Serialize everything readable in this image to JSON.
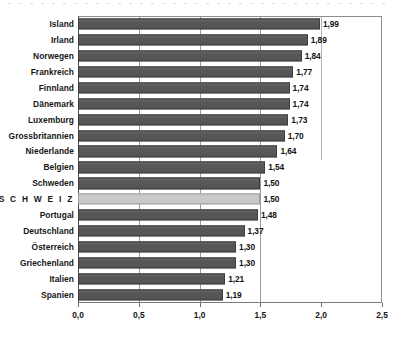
{
  "chart_data": {
    "type": "bar",
    "orientation": "horizontal",
    "title": "",
    "subtitle": "",
    "xlabel": "",
    "ylabel": "",
    "xlim": [
      0.0,
      2.5
    ],
    "xticks": [
      0.0,
      0.5,
      1.0,
      1.5,
      2.0,
      2.5
    ],
    "xtick_labels": [
      "0,0",
      "0,5",
      "1,0",
      "1,5",
      "2,0",
      "2,5"
    ],
    "grid": true,
    "gridlines_at": [
      0.5,
      1.0,
      1.5,
      2.0
    ],
    "legend": null,
    "decimal_separator": ",",
    "highlight_category": "S C H W E I Z",
    "colors": {
      "bar": "#585858",
      "bar_border": "#3e3e3e",
      "highlight_bar": "#c9c9c9",
      "highlight_bar_border": "#9d9d9d",
      "axis": "#4a4a4a",
      "gridline": "#9a9a9a",
      "text": "#161616",
      "background": "#ffffff"
    },
    "categories": [
      "Island",
      "Irland",
      "Norwegen",
      "Frankreich",
      "Finnland",
      "Dänemark",
      "Luxemburg",
      "Grossbritannien",
      "Niederlande",
      "Belgien",
      "Schweden",
      "S C H W E I Z",
      "Portugal",
      "Deutschland",
      "Österreich",
      "Griechenland",
      "Italien",
      "Spanien"
    ],
    "values": [
      1.99,
      1.89,
      1.84,
      1.77,
      1.74,
      1.74,
      1.73,
      1.7,
      1.64,
      1.54,
      1.5,
      1.5,
      1.48,
      1.37,
      1.3,
      1.3,
      1.21,
      1.19
    ],
    "value_labels": [
      "1,99",
      "1,89",
      "1,84",
      "1,77",
      "1,74",
      "1,74",
      "1,73",
      "1,70",
      "1,64",
      "1,54",
      "1,50",
      "1,50",
      "1,48",
      "1,37",
      "1,30",
      "1,30",
      "1,21",
      "1,19"
    ],
    "bars": [
      {
        "category": "Island",
        "value": 1.99,
        "label": "1,99",
        "highlight": false
      },
      {
        "category": "Irland",
        "value": 1.89,
        "label": "1,89",
        "highlight": false
      },
      {
        "category": "Norwegen",
        "value": 1.84,
        "label": "1,84",
        "highlight": false
      },
      {
        "category": "Frankreich",
        "value": 1.77,
        "label": "1,77",
        "highlight": false
      },
      {
        "category": "Finnland",
        "value": 1.74,
        "label": "1,74",
        "highlight": false
      },
      {
        "category": "Dänemark",
        "value": 1.74,
        "label": "1,74",
        "highlight": false
      },
      {
        "category": "Luxemburg",
        "value": 1.73,
        "label": "1,73",
        "highlight": false
      },
      {
        "category": "Grossbritannien",
        "value": 1.7,
        "label": "1,70",
        "highlight": false
      },
      {
        "category": "Niederlande",
        "value": 1.64,
        "label": "1,64",
        "highlight": false
      },
      {
        "category": "Belgien",
        "value": 1.54,
        "label": "1,54",
        "highlight": false
      },
      {
        "category": "Schweden",
        "value": 1.5,
        "label": "1,50",
        "highlight": false
      },
      {
        "category": "S C H W E I Z",
        "value": 1.5,
        "label": "1,50",
        "highlight": true
      },
      {
        "category": "Portugal",
        "value": 1.48,
        "label": "1,48",
        "highlight": false
      },
      {
        "category": "Deutschland",
        "value": 1.37,
        "label": "1,37",
        "highlight": false
      },
      {
        "category": "Österreich",
        "value": 1.3,
        "label": "1,30",
        "highlight": false
      },
      {
        "category": "Griechenland",
        "value": 1.3,
        "label": "1,30",
        "highlight": false
      },
      {
        "category": "Italien",
        "value": 1.21,
        "label": "1,21",
        "highlight": false
      },
      {
        "category": "Spanien",
        "value": 1.19,
        "label": "1,19",
        "highlight": false
      }
    ]
  }
}
